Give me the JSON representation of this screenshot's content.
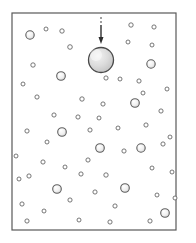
{
  "figure": {
    "kind": "particle-dispersion-diagram",
    "caption": "",
    "canvas": {
      "width": 196,
      "height": 243,
      "background": "#ffffff"
    },
    "frame": {
      "name": "enclosure-box",
      "x": 12,
      "y": 13,
      "width": 164,
      "height": 217,
      "stroke": "#595959",
      "stroke_width": 1.2,
      "fill": "#ffffff"
    },
    "style": {
      "particle_stroke": "#5e5e5e",
      "particle_fill": "#ffffff",
      "large_particle_fill": "#d8d8d8",
      "tracer_fill": "#d6d6d6",
      "tracer_stroke": "#4a4a4a",
      "arrow_color": "#2e2e2e"
    },
    "arrow": {
      "name": "injection-arrow",
      "label": "",
      "direction": "down",
      "x": 101,
      "y_start": 17,
      "y_end": 44,
      "head_width": 5,
      "head_length": 7,
      "shaft_width": 1.4,
      "dashed_tail_from": 17,
      "dashed_tail_to": 24
    },
    "tracer_particle": {
      "name": "tracer-sphere",
      "cx": 101,
      "cy": 60,
      "r": 12.5,
      "stroke_width": 1.3,
      "highlight_cx": 96,
      "highlight_cy": 55,
      "highlight_r": 6
    },
    "particles": [
      {
        "cx": 30,
        "cy": 35,
        "r": 4.2
      },
      {
        "cx": 46,
        "cy": 29,
        "r": 2.0
      },
      {
        "cx": 62,
        "cy": 31,
        "r": 2.2
      },
      {
        "cx": 70,
        "cy": 47,
        "r": 2.3
      },
      {
        "cx": 33,
        "cy": 65,
        "r": 2.2
      },
      {
        "cx": 61,
        "cy": 76,
        "r": 4.3
      },
      {
        "cx": 23,
        "cy": 84,
        "r": 2.0
      },
      {
        "cx": 37,
        "cy": 97,
        "r": 2.1
      },
      {
        "cx": 82,
        "cy": 99,
        "r": 2.2
      },
      {
        "cx": 106,
        "cy": 78,
        "r": 2.1
      },
      {
        "cx": 120,
        "cy": 79,
        "r": 2.0
      },
      {
        "cx": 131,
        "cy": 25,
        "r": 2.2
      },
      {
        "cx": 154,
        "cy": 27,
        "r": 2.1
      },
      {
        "cx": 128,
        "cy": 42,
        "r": 2.0
      },
      {
        "cx": 152,
        "cy": 45,
        "r": 2.0
      },
      {
        "cx": 151,
        "cy": 64,
        "r": 4.2
      },
      {
        "cx": 139,
        "cy": 81,
        "r": 2.1
      },
      {
        "cx": 103,
        "cy": 104,
        "r": 2.1
      },
      {
        "cx": 143,
        "cy": 93,
        "r": 2.0
      },
      {
        "cx": 167,
        "cy": 89,
        "r": 2.0
      },
      {
        "cx": 135,
        "cy": 103,
        "r": 4.3
      },
      {
        "cx": 161,
        "cy": 111,
        "r": 2.1
      },
      {
        "cx": 54,
        "cy": 115,
        "r": 2.1
      },
      {
        "cx": 78,
        "cy": 117,
        "r": 2.1
      },
      {
        "cx": 99,
        "cy": 118,
        "r": 2.0
      },
      {
        "cx": 27,
        "cy": 131,
        "r": 2.1
      },
      {
        "cx": 62,
        "cy": 132,
        "r": 4.3
      },
      {
        "cx": 90,
        "cy": 130,
        "r": 2.1
      },
      {
        "cx": 118,
        "cy": 128,
        "r": 2.0
      },
      {
        "cx": 146,
        "cy": 125,
        "r": 2.1
      },
      {
        "cx": 170,
        "cy": 137,
        "r": 2.0
      },
      {
        "cx": 100,
        "cy": 148,
        "r": 4.3
      },
      {
        "cx": 124,
        "cy": 151,
        "r": 2.1
      },
      {
        "cx": 141,
        "cy": 148,
        "r": 4.2
      },
      {
        "cx": 163,
        "cy": 144,
        "r": 2.1
      },
      {
        "cx": 88,
        "cy": 160,
        "r": 2.1
      },
      {
        "cx": 65,
        "cy": 167,
        "r": 2.0
      },
      {
        "cx": 43,
        "cy": 162,
        "r": 2.1
      },
      {
        "cx": 19,
        "cy": 179,
        "r": 2.0
      },
      {
        "cx": 29,
        "cy": 176,
        "r": 2.1
      },
      {
        "cx": 81,
        "cy": 174,
        "r": 2.1
      },
      {
        "cx": 106,
        "cy": 175,
        "r": 2.2
      },
      {
        "cx": 152,
        "cy": 168,
        "r": 2.0
      },
      {
        "cx": 172,
        "cy": 172,
        "r": 2.0
      },
      {
        "cx": 57,
        "cy": 189,
        "r": 4.3
      },
      {
        "cx": 125,
        "cy": 188,
        "r": 4.3
      },
      {
        "cx": 95,
        "cy": 192,
        "r": 2.1
      },
      {
        "cx": 70,
        "cy": 200,
        "r": 2.1
      },
      {
        "cx": 157,
        "cy": 195,
        "r": 2.0
      },
      {
        "cx": 175,
        "cy": 198,
        "r": 2.0
      },
      {
        "cx": 22,
        "cy": 204,
        "r": 2.1
      },
      {
        "cx": 44,
        "cy": 211,
        "r": 2.0
      },
      {
        "cx": 115,
        "cy": 206,
        "r": 2.1
      },
      {
        "cx": 165,
        "cy": 213,
        "r": 4.3
      },
      {
        "cx": 27,
        "cy": 221,
        "r": 2.1
      },
      {
        "cx": 79,
        "cy": 220,
        "r": 2.0
      },
      {
        "cx": 110,
        "cy": 222,
        "r": 2.1
      },
      {
        "cx": 150,
        "cy": 221,
        "r": 2.1
      },
      {
        "cx": 47,
        "cy": 142,
        "r": 2.0
      },
      {
        "cx": 16,
        "cy": 156,
        "r": 2.0
      }
    ]
  }
}
